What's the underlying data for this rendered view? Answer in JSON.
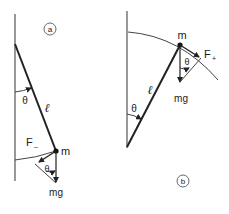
{
  "diagram_a": {
    "panel_label": "a",
    "angle_label": "θ",
    "length_label": "ℓ",
    "force_label": "F",
    "force_sub": "–",
    "mass_label": "m",
    "weight_label": "mg",
    "triangle_angle_label": "θ"
  },
  "diagram_b": {
    "panel_label": "b",
    "angle_label": "θ",
    "length_label": "ℓ",
    "force_label": "F",
    "force_sub": "+",
    "mass_label": "m",
    "weight_label": "mg",
    "triangle_angle_label": "θ"
  },
  "colors": {
    "ink": "#222222",
    "background": "#ffffff"
  }
}
